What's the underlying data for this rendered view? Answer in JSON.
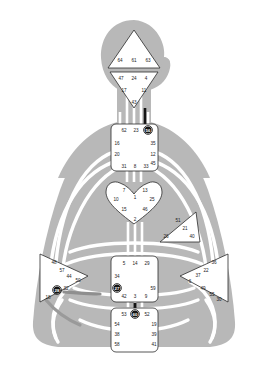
{
  "diagram": {
    "colors": {
      "body_silhouette": "#b8b8b8",
      "channel_open": "#ffffff",
      "channel_defined_dark": "#8a8a8a",
      "channel_defined_black": "#141414",
      "center_fill": "#ffffff",
      "center_stroke": "#2b2b2b",
      "gate_text": "#1a1a1a",
      "gate_active_fill": "#141414",
      "gate_active_text": "#ffffff",
      "background": "#ffffff"
    }
  },
  "centers": [
    {
      "name": "head",
      "shape": "triangle",
      "defined": false,
      "gates": [
        {
          "number": "64",
          "x": 120,
          "y": 60,
          "active": false
        },
        {
          "number": "61",
          "x": 134,
          "y": 60,
          "active": false
        },
        {
          "number": "63",
          "x": 148,
          "y": 60,
          "active": false
        }
      ]
    },
    {
      "name": "ajna",
      "shape": "triangle-down",
      "defined": false,
      "gates": [
        {
          "number": "47",
          "x": 121,
          "y": 78,
          "active": false
        },
        {
          "number": "24",
          "x": 134,
          "y": 78,
          "active": false
        },
        {
          "number": "4",
          "x": 146,
          "y": 78,
          "active": false
        },
        {
          "number": "17",
          "x": 124,
          "y": 90,
          "active": false
        },
        {
          "number": "11",
          "x": 144,
          "y": 90,
          "active": false
        },
        {
          "number": "43",
          "x": 134,
          "y": 102,
          "active": false
        }
      ]
    },
    {
      "name": "throat",
      "shape": "square",
      "defined": false,
      "gates": [
        {
          "number": "62",
          "x": 124,
          "y": 130,
          "active": false
        },
        {
          "number": "23",
          "x": 136,
          "y": 130,
          "active": false
        },
        {
          "number": "56",
          "x": 148,
          "y": 130,
          "active": true
        },
        {
          "number": "16",
          "x": 117,
          "y": 143,
          "active": false
        },
        {
          "number": "35",
          "x": 153,
          "y": 143,
          "active": false
        },
        {
          "number": "20",
          "x": 117,
          "y": 154,
          "active": false
        },
        {
          "number": "12",
          "x": 153,
          "y": 154,
          "active": false
        },
        {
          "number": "31",
          "x": 124,
          "y": 166,
          "active": false
        },
        {
          "number": "8",
          "x": 135,
          "y": 166,
          "active": false
        },
        {
          "number": "33",
          "x": 146,
          "y": 166,
          "active": false
        },
        {
          "number": "45",
          "x": 153,
          "y": 163,
          "active": false
        }
      ]
    },
    {
      "name": "g-center",
      "shape": "heart",
      "defined": false,
      "gates": [
        {
          "number": "7",
          "x": 124,
          "y": 190,
          "active": false
        },
        {
          "number": "13",
          "x": 145,
          "y": 190,
          "active": false
        },
        {
          "number": "1",
          "x": 135,
          "y": 197,
          "active": false
        },
        {
          "number": "10",
          "x": 116,
          "y": 199,
          "active": false
        },
        {
          "number": "25",
          "x": 152,
          "y": 199,
          "active": false
        },
        {
          "number": "15",
          "x": 124,
          "y": 209,
          "active": false
        },
        {
          "number": "46",
          "x": 145,
          "y": 209,
          "active": false
        },
        {
          "number": "2",
          "x": 135,
          "y": 219,
          "active": false
        }
      ]
    },
    {
      "name": "ego-heart",
      "shape": "triangle-right",
      "defined": false,
      "gates": [
        {
          "number": "51",
          "x": 178,
          "y": 220,
          "active": false
        },
        {
          "number": "21",
          "x": 185,
          "y": 228,
          "active": false
        },
        {
          "number": "26",
          "x": 166,
          "y": 236,
          "active": false
        },
        {
          "number": "40",
          "x": 192,
          "y": 236,
          "active": false
        }
      ]
    },
    {
      "name": "spleen",
      "shape": "triangle-left",
      "defined": false,
      "gates": [
        {
          "number": "48",
          "x": 54,
          "y": 262,
          "active": false
        },
        {
          "number": "57",
          "x": 62,
          "y": 270,
          "active": false
        },
        {
          "number": "44",
          "x": 69,
          "y": 276,
          "active": false
        },
        {
          "number": "50",
          "x": 78,
          "y": 280,
          "active": false
        },
        {
          "number": "32",
          "x": 66,
          "y": 288,
          "active": false
        },
        {
          "number": "28",
          "x": 57,
          "y": 290,
          "active": true
        },
        {
          "number": "18",
          "x": 48,
          "y": 297,
          "active": false
        }
      ]
    },
    {
      "name": "solar-plexus",
      "shape": "triangle-right",
      "defined": false,
      "gates": [
        {
          "number": "36",
          "x": 214,
          "y": 262,
          "active": false
        },
        {
          "number": "22",
          "x": 206,
          "y": 270,
          "active": false
        },
        {
          "number": "37",
          "x": 198,
          "y": 275,
          "active": false
        },
        {
          "number": "6",
          "x": 190,
          "y": 281,
          "active": false
        },
        {
          "number": "49",
          "x": 203,
          "y": 288,
          "active": false
        },
        {
          "number": "55",
          "x": 212,
          "y": 294,
          "active": false
        },
        {
          "number": "30",
          "x": 219,
          "y": 299,
          "active": false
        }
      ]
    },
    {
      "name": "sacral",
      "shape": "square",
      "defined": false,
      "gates": [
        {
          "number": "5",
          "x": 124,
          "y": 263,
          "active": false
        },
        {
          "number": "14",
          "x": 135,
          "y": 263,
          "active": false
        },
        {
          "number": "29",
          "x": 147,
          "y": 263,
          "active": false
        },
        {
          "number": "34",
          "x": 117,
          "y": 276,
          "active": false
        },
        {
          "number": "27",
          "x": 117,
          "y": 288,
          "active": true
        },
        {
          "number": "59",
          "x": 153,
          "y": 288,
          "active": false
        },
        {
          "number": "42",
          "x": 124,
          "y": 296,
          "active": false
        },
        {
          "number": "3",
          "x": 135,
          "y": 296,
          "active": false
        },
        {
          "number": "9",
          "x": 146,
          "y": 296,
          "active": false
        }
      ]
    },
    {
      "name": "root",
      "shape": "square",
      "defined": false,
      "gates": [
        {
          "number": "53",
          "x": 124,
          "y": 314,
          "active": false
        },
        {
          "number": "60",
          "x": 135,
          "y": 314,
          "active": true
        },
        {
          "number": "52",
          "x": 147,
          "y": 314,
          "active": false
        },
        {
          "number": "54",
          "x": 117,
          "y": 324,
          "active": false
        },
        {
          "number": "19",
          "x": 154,
          "y": 324,
          "active": false
        },
        {
          "number": "38",
          "x": 117,
          "y": 334,
          "active": false
        },
        {
          "number": "39",
          "x": 154,
          "y": 334,
          "active": false
        },
        {
          "number": "58",
          "x": 117,
          "y": 344,
          "active": false
        },
        {
          "number": "41",
          "x": 154,
          "y": 344,
          "active": false
        }
      ]
    }
  ]
}
